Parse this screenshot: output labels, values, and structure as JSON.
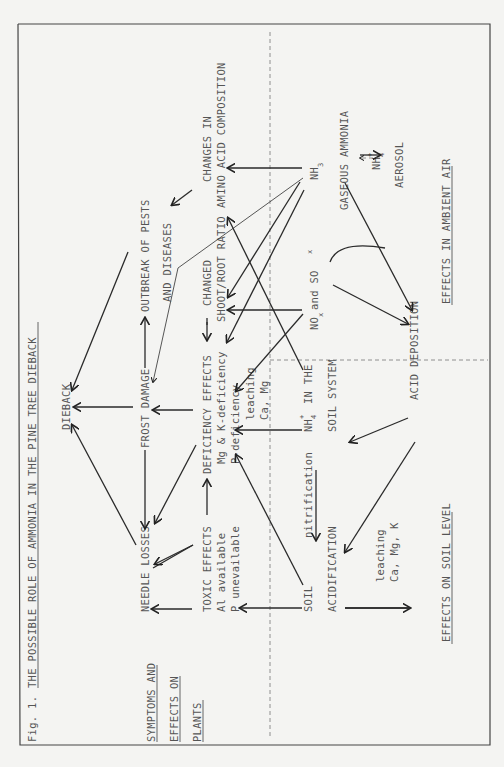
{
  "figure": {
    "caption_prefix": "Fig. 1.",
    "title": "THE POSSIBLE ROLE OF AMMONIA IN THE PINE TREE DIEBACK"
  },
  "regions": {
    "plants": [
      "SYMPTOMS AND",
      "EFFECTS ON",
      "PLANTS"
    ],
    "soil": "EFFECTS ON SOIL LEVEL",
    "air": "EFFECTS IN AMBIENT AIR"
  },
  "nodes": {
    "dieback": "DIEBACK",
    "needle_losses": "NEEDLE LOSSES",
    "frost_damage": "FROST DAMAGE",
    "pests": [
      "OUTBREAK OF PESTS",
      "AND DISEASES"
    ],
    "toxic": [
      "TOXIC EFFECTS",
      "Al available",
      "P unevailable"
    ],
    "deficiency": [
      "DEFICIENCY EFFECTS",
      "Mg & K-deficiency",
      "P-deficiency"
    ],
    "shoot_root": [
      "CHANGED",
      "SHOOT/ROOT RATIO"
    ],
    "amino": [
      "CHANGES IN",
      "AMINO ACID COMPOSITION"
    ],
    "soil_acid": [
      "SOIL",
      "ACIDIFICATION"
    ],
    "nitrification": "nitrification",
    "nh4_soil": [
      "NH",
      "4",
      "+",
      "IN THE",
      "SOIL SYSTEM"
    ],
    "leaching_top": [
      "leaching",
      "Ca, Mg"
    ],
    "leaching_bottom": [
      "leaching",
      "Ca, Mg, K"
    ],
    "nox_sox": [
      "NO",
      "x",
      " and SO",
      "x"
    ],
    "nh3": [
      "NH",
      "3",
      "GASEOUS AMMONIA"
    ],
    "aerosol": [
      "NH",
      "4",
      "+",
      "AEROSOL"
    ],
    "acid_deposition": "ACID DEPOSITION"
  }
}
